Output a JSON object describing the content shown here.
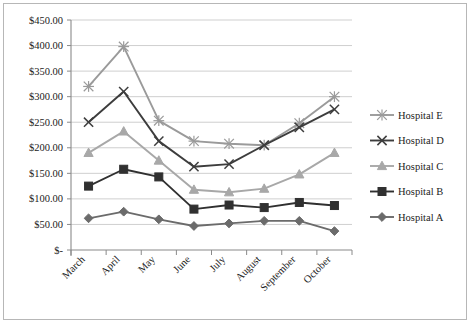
{
  "chart_data": {
    "type": "line",
    "title": "",
    "xlabel": "",
    "ylabel": "",
    "categories": [
      "March",
      "April",
      "May",
      "June",
      "July",
      "August",
      "September",
      "October"
    ],
    "ylim": [
      0,
      450
    ],
    "ytick_step": 50,
    "ytick_labels": [
      "$-",
      "$50.00",
      "$100.00",
      "$150.00",
      "$200.00",
      "$250.00",
      "$300.00",
      "$350.00",
      "$400.00",
      "$450.00"
    ],
    "ytick_values": [
      0,
      50,
      100,
      150,
      200,
      250,
      300,
      350,
      400,
      450
    ],
    "grid": "horizontal",
    "legend_position": "right",
    "currency_prefix": "$",
    "series": [
      {
        "name": "Hospital E",
        "marker": "asterisk",
        "color": "#9a9a9a",
        "values": [
          320,
          398,
          253,
          213,
          208,
          205,
          248,
          300
        ]
      },
      {
        "name": "Hospital D",
        "marker": "x",
        "color": "#3d3d3d",
        "values": [
          250,
          310,
          213,
          163,
          168,
          205,
          240,
          275
        ]
      },
      {
        "name": "Hospital C",
        "marker": "triangle",
        "color": "#a8a8a8",
        "values": [
          190,
          232,
          175,
          118,
          113,
          120,
          148,
          190
        ]
      },
      {
        "name": "Hospital B",
        "marker": "square",
        "color": "#303030",
        "values": [
          125,
          158,
          143,
          80,
          88,
          83,
          93,
          87
        ]
      },
      {
        "name": "Hospital A",
        "marker": "diamond",
        "color": "#6b6b6b",
        "values": [
          62,
          75,
          60,
          47,
          52,
          57,
          57,
          37
        ]
      }
    ]
  },
  "legend": {
    "items": [
      {
        "label": "Hospital E"
      },
      {
        "label": "Hospital D"
      },
      {
        "label": "Hospital C"
      },
      {
        "label": "Hospital B"
      },
      {
        "label": "Hospital A"
      }
    ]
  },
  "axis": {
    "y_labels": [
      "$450.00",
      "$400.00",
      "$350.00",
      "$300.00",
      "$250.00",
      "$200.00",
      "$150.00",
      "$100.00",
      "$50.00",
      "$-"
    ],
    "x_labels": [
      "March",
      "April",
      "May",
      "June",
      "July",
      "August",
      "September",
      "October"
    ]
  }
}
